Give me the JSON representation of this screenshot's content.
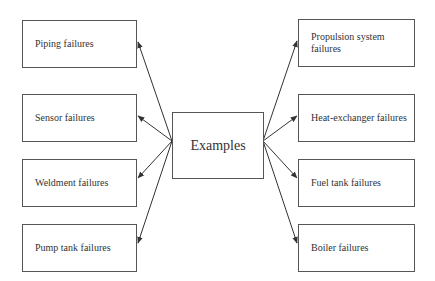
{
  "diagram": {
    "center": {
      "label": "Examples"
    },
    "left_items": [
      {
        "label": "Piping failures"
      },
      {
        "label": "Sensor failures"
      },
      {
        "label": "Weldment failures"
      },
      {
        "label": "Pump tank failures"
      }
    ],
    "right_items": [
      {
        "label": "Propulsion system failures"
      },
      {
        "label": "Heat-exchanger failures"
      },
      {
        "label": "Fuel tank failures"
      },
      {
        "label": "Boiler failures"
      }
    ],
    "edges": [
      {
        "from": "Examples",
        "to": "Piping failures"
      },
      {
        "from": "Examples",
        "to": "Sensor failures"
      },
      {
        "from": "Examples",
        "to": "Weldment failures"
      },
      {
        "from": "Examples",
        "to": "Pump tank failures"
      },
      {
        "from": "Examples",
        "to": "Propulsion system failures"
      },
      {
        "from": "Examples",
        "to": "Heat-exchanger failures"
      },
      {
        "from": "Examples",
        "to": "Fuel tank failures"
      },
      {
        "from": "Examples",
        "to": "Boiler failures"
      }
    ]
  }
}
